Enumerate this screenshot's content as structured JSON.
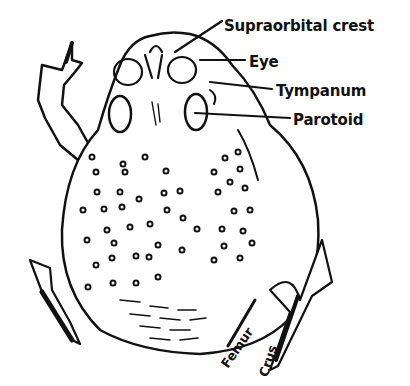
{
  "diagram": {
    "colors": {
      "ink": "#111111",
      "paper": "#ffffff"
    },
    "labels": [
      {
        "id": "supraorbital-crest",
        "text": "Supraorbital crest",
        "x": 224,
        "y": 27
      },
      {
        "id": "eye",
        "text": "Eye",
        "x": 249,
        "y": 63
      },
      {
        "id": "tympanum",
        "text": "Tympanum",
        "x": 276,
        "y": 92
      },
      {
        "id": "parotoid",
        "text": "Parotoid",
        "x": 293,
        "y": 121
      }
    ],
    "leg_labels": [
      {
        "id": "femur",
        "text": "Femur",
        "x": 218,
        "y": 352,
        "rotate": -55
      },
      {
        "id": "crus",
        "text": "Crus",
        "x": 256,
        "y": 364,
        "rotate": -72
      }
    ]
  }
}
